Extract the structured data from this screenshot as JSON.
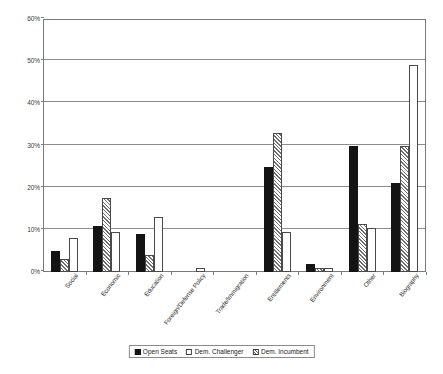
{
  "chart_data": {
    "type": "bar",
    "title": "",
    "subtitle": "",
    "xlabel": "",
    "ylabel": "",
    "ylim": [
      0,
      60
    ],
    "ytick_labels": [
      "0%",
      "10%",
      "20%",
      "30%",
      "40%",
      "50%",
      "60%"
    ],
    "ytick_values": [
      0,
      10,
      20,
      30,
      40,
      50,
      60
    ],
    "grid": true,
    "legend_position": "bottom",
    "categories": [
      "Social",
      "Economic",
      "Education",
      "Foreign/Defense Policy",
      "Trade/Immigration",
      "Entitlements",
      "Environment",
      "Other",
      "Biography"
    ],
    "series": [
      {
        "name": "Open Seats",
        "fill": "solid-black",
        "color": "#141414",
        "values": [
          5.0,
          11.0,
          9.0,
          0.0,
          0.0,
          25.0,
          2.0,
          30.0,
          21.0
        ]
      },
      {
        "name": "Dem. Incumbent",
        "fill": "diagonal-hatch",
        "color": "#6e6e6e",
        "values": [
          3.0,
          17.5,
          4.0,
          0.0,
          0.0,
          33.0,
          1.0,
          11.5,
          30.0
        ]
      },
      {
        "name": "Dem. Challenger",
        "fill": "white-outline",
        "color": "#ffffff",
        "values": [
          8.0,
          9.5,
          13.0,
          1.0,
          0.0,
          9.5,
          1.0,
          10.5,
          49.0
        ]
      }
    ]
  },
  "legend": {
    "items": [
      {
        "label": "Open Seats",
        "swatch": "open-seats"
      },
      {
        "label": "Dem. Challenger",
        "swatch": "dem-challenger"
      },
      {
        "label": "Dem. Incumbent",
        "swatch": "dem-incumbent"
      }
    ]
  },
  "colors": {
    "axis": "#7a7a7a",
    "grid": "#8c8c8c",
    "text": "#1a1a1a",
    "background": "#ffffff"
  }
}
